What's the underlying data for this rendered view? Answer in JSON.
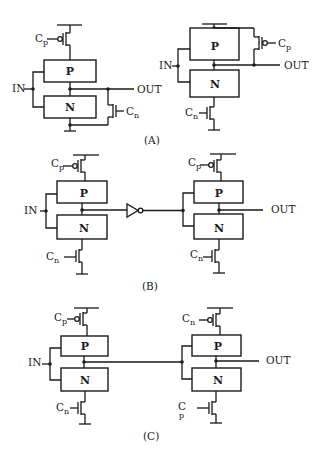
{
  "figure": {
    "panels": [
      {
        "id": "A",
        "caption": "(A)",
        "circuits": [
          {
            "blocks": {
              "pull_up": "P",
              "pull_down": "N"
            },
            "input_label": "IN",
            "output_label": "OUT",
            "clock_p": {
              "base": "C",
              "sub": "p"
            },
            "clock_n": {
              "base": "C",
              "sub": "n"
            }
          },
          {
            "blocks": {
              "pull_up": "P",
              "pull_down": "N"
            },
            "input_label": "IN",
            "output_label": "OUT",
            "clock_p": {
              "base": "C",
              "sub": "p"
            },
            "clock_n": {
              "base": "C",
              "sub": "n"
            }
          }
        ]
      },
      {
        "id": "B",
        "caption": "(B)",
        "circuits": [
          {
            "blocks": {
              "pull_up": "P",
              "pull_down": "N"
            },
            "input_label": "IN",
            "clock_p": {
              "base": "C",
              "sub": "p"
            },
            "clock_n": {
              "base": "C",
              "sub": "n"
            }
          },
          {
            "blocks": {
              "pull_up": "P",
              "pull_down": "N"
            },
            "output_label": "OUT",
            "clock_p": {
              "base": "C",
              "sub": "p"
            },
            "clock_n": {
              "base": "C",
              "sub": "n"
            }
          }
        ],
        "inverter": "inverter"
      },
      {
        "id": "C",
        "caption": "(C)",
        "circuits": [
          {
            "blocks": {
              "pull_up": "P",
              "pull_down": "N"
            },
            "input_label": "IN",
            "clock_p": {
              "base": "C",
              "sub": "p"
            },
            "clock_n": {
              "base": "C",
              "sub": "n"
            }
          },
          {
            "blocks": {
              "pull_up": "P",
              "pull_down": "N"
            },
            "output_label": "OUT",
            "clock_p": {
              "base": "C",
              "sub": "n"
            },
            "clock_n": {
              "base": "C",
              "sub": "p"
            }
          }
        ]
      }
    ]
  }
}
